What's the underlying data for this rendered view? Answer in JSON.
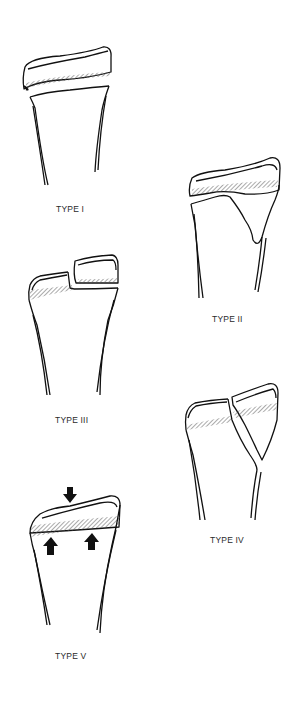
{
  "figure": {
    "panels": [
      {
        "id": "type-1",
        "label": "TYPE I",
        "description": "Fracture through the physis; epiphysis separated from metaphysis"
      },
      {
        "id": "type-2",
        "label": "TYPE II",
        "description": "Fracture through physis exiting through metaphysis"
      },
      {
        "id": "type-3",
        "label": "TYPE III",
        "description": "Fracture through physis exiting through epiphysis"
      },
      {
        "id": "type-4",
        "label": "TYPE IV",
        "description": "Fracture crossing epiphysis, physis and metaphysis"
      },
      {
        "id": "type-5",
        "label": "TYPE V",
        "description": "Crush injury of the physis"
      }
    ],
    "colors": {
      "line": "#111111",
      "hatch": "#555555",
      "background": "#ffffff"
    }
  }
}
